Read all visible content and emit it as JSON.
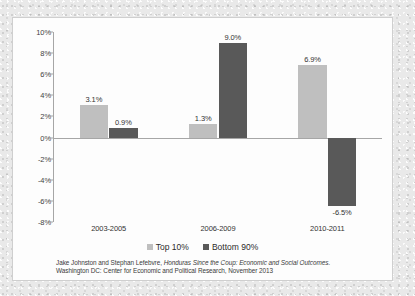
{
  "chart_data": {
    "type": "bar",
    "title": "",
    "subtitle": "",
    "xlabel": "",
    "ylabel": "",
    "categories": [
      "2003-2005",
      "2006-2009",
      "2010-2011"
    ],
    "series": [
      {
        "name": "Top 10%",
        "color": "#bfbfbf",
        "values": [
          3.1,
          1.3,
          6.9
        ],
        "value_labels": [
          "3.1%",
          "1.3%",
          "6.9%"
        ]
      },
      {
        "name": "Bottom 90%",
        "color": "#595959",
        "values": [
          0.9,
          9.0,
          -6.5
        ],
        "value_labels": [
          "0.9%",
          "9.0%",
          "-6.5%"
        ]
      }
    ],
    "ylim": [
      -8,
      10
    ],
    "ytick_step": 2,
    "ytick_labels": [
      "10%",
      "8%",
      "6%",
      "4%",
      "2%",
      "0%",
      "-2%",
      "-4%",
      "-6%",
      "-8%"
    ],
    "ytick_values": [
      10,
      8,
      6,
      4,
      2,
      0,
      -2,
      -4,
      -6,
      -8
    ],
    "grid": false,
    "legend_position": "bottom"
  },
  "legend": {
    "items": [
      {
        "label": "Top 10%",
        "swatch": "light"
      },
      {
        "label": "Bottom 90%",
        "swatch": "dark"
      }
    ]
  },
  "caption": {
    "line1_pre": "Jake Johnston and Stephan Lefebvre, ",
    "line1_italic": "Honduras Since the Coup: Economic and Social Outcomes",
    "line1_post": ".",
    "line2": "Washington DC: Center for Economic and Political Research, November 2013"
  }
}
